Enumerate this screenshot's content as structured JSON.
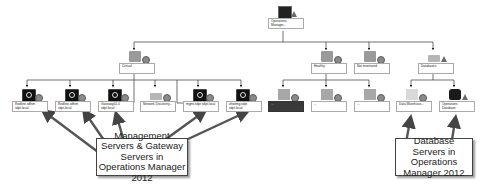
{
  "diagram": {
    "root": {
      "label": "Operations Manager...",
      "icon": "monitor-screen-icon",
      "status": "warning"
    },
    "groups": [
      {
        "id": "critical",
        "label": "Critical",
        "icon": "folder-icon",
        "status": "ok"
      },
      {
        "id": "healthy",
        "label": "Healthy",
        "icon": "folder-icon",
        "status": "ok"
      },
      {
        "id": "not-monitored",
        "label": "Not monitored",
        "icon": "folder-icon",
        "status": "ok"
      },
      {
        "id": "databases",
        "label": "Databases",
        "icon": "database-group-icon",
        "status": "warning"
      }
    ],
    "critical_children": [
      {
        "label": "Redline.sdfsm sdpt.local",
        "icon": "monitor-icon"
      },
      {
        "label": "Redline.sdfsm sdpt.local",
        "icon": "monitor-icon"
      },
      {
        "label": "Gateway01.0 sdpt.local",
        "icon": "monitor-icon"
      },
      {
        "label": "Network Discovery...",
        "icon": "group-icon"
      },
      {
        "label": "mgmt.sdpt sdpt.local",
        "icon": "monitor-icon"
      },
      {
        "label": "ohwtmg.sdpt sdpt.local",
        "icon": "monitor-icon"
      }
    ],
    "healthy_children": [
      {
        "label": "...",
        "icon": "server-icon",
        "dark": true
      },
      {
        "label": "...",
        "icon": "server-icon",
        "dark": false
      },
      {
        "label": "...",
        "icon": "server-icon",
        "dark": false
      }
    ],
    "database_children": [
      {
        "label": "Data Warehous...",
        "icon": "database-light-icon"
      },
      {
        "label": "Operations Database",
        "icon": "database-icon"
      }
    ]
  },
  "callouts": {
    "management": "Management Servers & Gateway Servers in Operations Manager 2012",
    "database": "Database Servers in Operations Manager 2012"
  },
  "colors": {
    "line": "#333333",
    "arrow": "#555555",
    "background": "#ffffff"
  }
}
